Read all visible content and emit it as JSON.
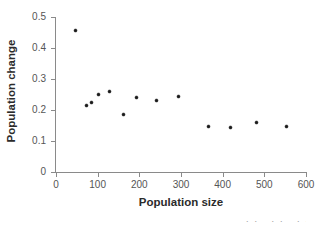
{
  "chart_data": {
    "type": "scatter",
    "title": "",
    "xlabel": "Population size",
    "ylabel": "Population change",
    "xlim": [
      0,
      600
    ],
    "ylim": [
      0,
      0.5
    ],
    "xticks": [
      0,
      100,
      200,
      300,
      400,
      500,
      600
    ],
    "xtick_labels": [
      "0",
      "100",
      "200",
      "300",
      "400",
      "500",
      "600"
    ],
    "yticks": [
      0,
      0.1,
      0.2,
      0.3,
      0.4,
      0.5
    ],
    "ytick_labels": [
      "0",
      "0.1",
      "0.2",
      "0.3",
      "0.4",
      "0.5"
    ],
    "grid": false,
    "legend": false,
    "marker": {
      "shape": "circle",
      "color": "#1a1a1a",
      "size": 3
    },
    "series": [
      {
        "name": "Population change",
        "points": [
          {
            "x": 47,
            "y": 0.458
          },
          {
            "x": 72,
            "y": 0.214
          },
          {
            "x": 85,
            "y": 0.224
          },
          {
            "x": 102,
            "y": 0.251
          },
          {
            "x": 128,
            "y": 0.261
          },
          {
            "x": 163,
            "y": 0.184
          },
          {
            "x": 193,
            "y": 0.239
          },
          {
            "x": 240,
            "y": 0.23
          },
          {
            "x": 293,
            "y": 0.245
          },
          {
            "x": 367,
            "y": 0.146
          },
          {
            "x": 419,
            "y": 0.143
          },
          {
            "x": 480,
            "y": 0.159
          },
          {
            "x": 553,
            "y": 0.148
          }
        ]
      }
    ]
  },
  "annotations": {
    "corner_fragments": ".. ..  .. .."
  }
}
